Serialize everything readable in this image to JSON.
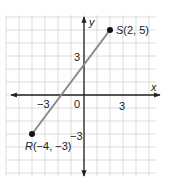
{
  "chart_data": {
    "type": "line",
    "title": "",
    "xlabel": "x",
    "ylabel": "y",
    "xlim": [
      -6,
      5.5
    ],
    "ylim": [
      -6.2,
      6.2
    ],
    "grid": true,
    "x_ticks": [
      {
        "value": -3,
        "label": "−3"
      },
      {
        "value": 0,
        "label": "0"
      },
      {
        "value": 3,
        "label": "3"
      }
    ],
    "y_ticks": [
      {
        "value": 3,
        "label": "3"
      },
      {
        "value": -3,
        "label": "−3"
      }
    ],
    "series": [
      {
        "name": "segment RS",
        "points": [
          {
            "x": -4,
            "y": -3
          },
          {
            "x": 2,
            "y": 5
          }
        ],
        "color": "#8a8a8a"
      }
    ],
    "annotations": [
      {
        "point": "R",
        "x": -4,
        "y": -3,
        "text_name": "R",
        "text_coords": "(−4, −3)"
      },
      {
        "point": "S",
        "x": 2,
        "y": 5,
        "text_name": "S",
        "text_coords": "(2, 5)"
      }
    ]
  },
  "labels": {
    "x_axis": "x",
    "y_axis": "y",
    "origin": "0",
    "x_tick_neg3": "−3",
    "x_tick_3": "3",
    "y_tick_3": "3",
    "y_tick_neg3": "−3",
    "S_name": "S",
    "S_coords": "(2, 5)",
    "R_name": "R",
    "R_coords": "(−4, −3)"
  },
  "colors": {
    "grid": "#d4d4d4",
    "axis": "#222222",
    "segment": "#8a8a8a",
    "point": "#111111"
  }
}
